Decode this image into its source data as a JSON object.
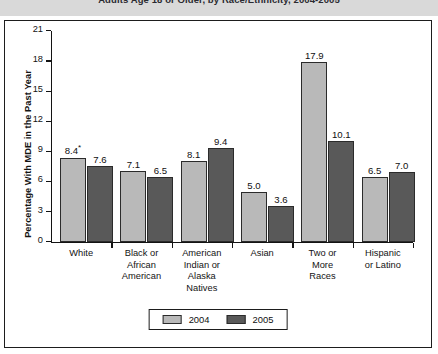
{
  "figure": {
    "title": "Adults Age 18 or Older, by Race/Ethnicity, 2004-2005"
  },
  "legend": {
    "items": [
      {
        "label": "2004",
        "color": "#b9b9b9"
      },
      {
        "label": "2005",
        "color": "#595959"
      }
    ]
  },
  "chart_data": {
    "type": "bar",
    "title": "Adults Age 18 or Older, by Race/Ethnicity, 2004-2005",
    "xlabel": "",
    "ylabel": "Percentage With MDE in the Past Year",
    "ylim": [
      0,
      21
    ],
    "yticks": [
      "0",
      "3",
      "6",
      "9",
      "12",
      "15",
      "18",
      "21"
    ],
    "grid": false,
    "legend_position": "bottom-center",
    "categories": [
      "White",
      "Black or African American",
      "American Indian or Alaska Natives",
      "Asian",
      "Two or More Races",
      "Hispanic or Latino"
    ],
    "category_label_lines": [
      [
        "White"
      ],
      [
        "Black or",
        "African",
        "American"
      ],
      [
        "American",
        "Indian or",
        "Alaska",
        "Natives"
      ],
      [
        "Asian"
      ],
      [
        "Two or",
        "More",
        "Races"
      ],
      [
        "Hispanic",
        "or Latino"
      ]
    ],
    "series": [
      {
        "name": "2004",
        "color": "#b9b9b9",
        "values": [
          8.4,
          7.1,
          8.1,
          5.0,
          17.9,
          6.5
        ],
        "labels": [
          "8.4",
          "7.1",
          "8.1",
          "5.0",
          "17.9",
          "6.5"
        ],
        "annotations": [
          "*",
          "",
          "",
          "",
          "",
          ""
        ]
      },
      {
        "name": "2005",
        "color": "#595959",
        "values": [
          7.6,
          6.5,
          9.4,
          3.6,
          10.1,
          7.0
        ],
        "labels": [
          "7.6",
          "6.5",
          "9.4",
          "3.6",
          "10.1",
          "7.0"
        ],
        "annotations": [
          "",
          "",
          "",
          "",
          "",
          ""
        ]
      }
    ]
  }
}
